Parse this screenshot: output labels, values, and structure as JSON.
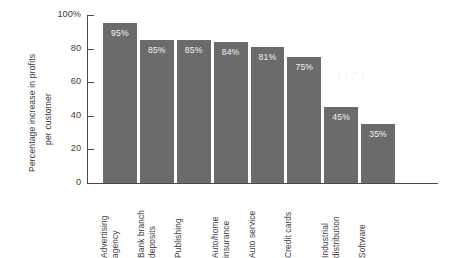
{
  "chart_data": {
    "type": "bar",
    "title": "",
    "subtitle": "",
    "xlabel": "",
    "ylabel": "Percentage increase in profits per customer",
    "ylabel_lines": [
      "Percentage increase in profits",
      "per customer"
    ],
    "categories": [
      "Advertising agency",
      "Bank branch deposits",
      "Publishing",
      "Auto/home insurance",
      "Auto service",
      "Credit cards",
      "Industrial distribution",
      "Software"
    ],
    "category_lines": [
      [
        "Advertising",
        "agency"
      ],
      [
        "Bank branch",
        "deposits"
      ],
      [
        "Publishing"
      ],
      [
        "Auto/home",
        "insurance"
      ],
      [
        "Auto service"
      ],
      [
        "Credit cards"
      ],
      [
        "Industrial",
        "distribution"
      ],
      [
        "Software"
      ]
    ],
    "values": [
      95,
      85,
      85,
      84,
      81,
      75,
      45,
      35
    ],
    "value_labels": [
      "95%",
      "85%",
      "85%",
      "84%",
      "81%",
      "75%",
      "45%",
      "35%"
    ],
    "ylim": [
      0,
      100
    ],
    "yticks": [
      0,
      20,
      40,
      60,
      80,
      100
    ],
    "ytick_labels": [
      "0",
      "20",
      "40",
      "60",
      "80",
      "100%"
    ],
    "grid": false,
    "legend": false,
    "legend_position": "none",
    "bar_color": "#6b6b6b",
    "value_label_color": "#f2f2f2",
    "axis_color": "#4a4a4a",
    "text_color": "#3c3c3c",
    "background_color": "#ffffff"
  },
  "artifact": {
    "faint_mark": "1173"
  }
}
